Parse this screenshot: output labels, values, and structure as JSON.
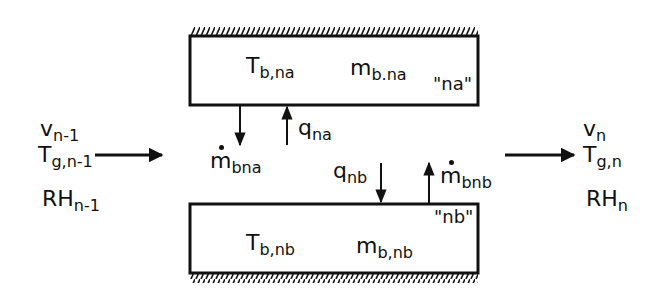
{
  "diagram": {
    "type": "control-volume schematic",
    "top_boundary": {
      "name": "na",
      "label_quoted": "\"na\"",
      "temperature": {
        "symbol": "T",
        "subscript": "b,na"
      },
      "mass": {
        "symbol": "m",
        "subscript": "b.na"
      }
    },
    "bottom_boundary": {
      "name": "nb",
      "label_quoted": "\"nb\"",
      "temperature": {
        "symbol": "T",
        "subscript": "b,nb"
      },
      "mass": {
        "symbol": "m",
        "subscript": "b,nb"
      }
    },
    "inlet": {
      "velocity": {
        "symbol": "v",
        "subscript": "n-1"
      },
      "gas_temperature": {
        "symbol": "T",
        "subscript": "g,n-1"
      },
      "humidity": {
        "symbol": "RH",
        "subscript": "n-1"
      }
    },
    "outlet": {
      "velocity": {
        "symbol": "v",
        "subscript": "n"
      },
      "gas_temperature": {
        "symbol": "T",
        "subscript": "g,n"
      },
      "humidity": {
        "symbol": "RH",
        "subscript": "n"
      }
    },
    "fluxes": {
      "m_bna": {
        "symbol": "m",
        "subscript": "bna",
        "dot": true,
        "direction": "down-from-top-boundary"
      },
      "q_na": {
        "symbol": "q",
        "subscript": "na",
        "direction": "up-to-top-boundary"
      },
      "q_nb": {
        "symbol": "q",
        "subscript": "nb",
        "direction": "down-to-bottom-boundary"
      },
      "m_bnb": {
        "symbol": "m",
        "subscript": "bnb",
        "dot": true,
        "direction": "up-from-bottom-boundary"
      }
    },
    "colors": {
      "ink": "#111111",
      "background": "#ffffff"
    }
  }
}
